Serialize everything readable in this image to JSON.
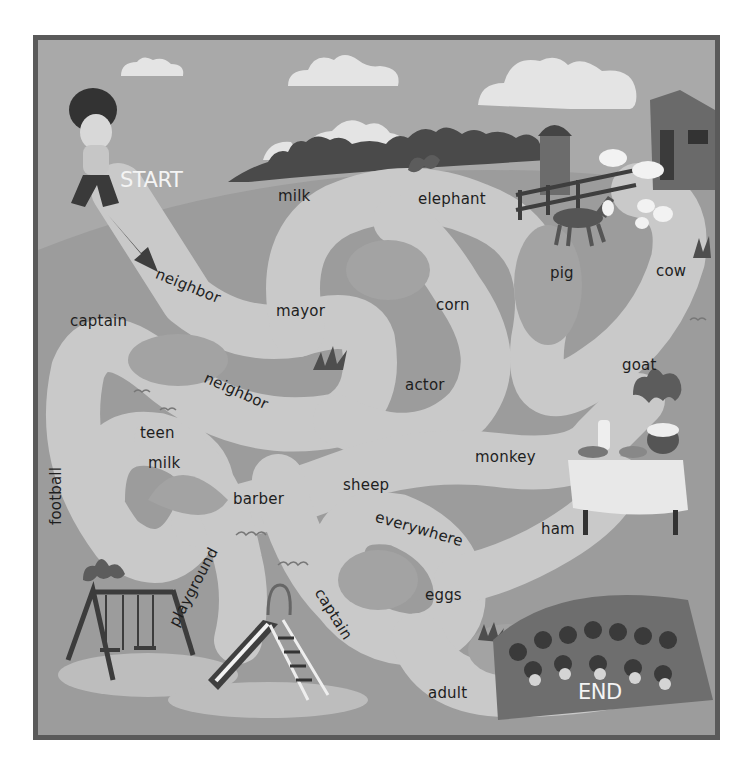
{
  "game": {
    "type": "word-maze",
    "start_label": "START",
    "end_label": "END"
  },
  "colors": {
    "frame": "#5a5a5a",
    "sky": "#a9a9a9",
    "cloud": "#e4e4e4",
    "hill": "#9c9c9c",
    "path": "#c9c9c9",
    "path_hole": "#a3a3a3",
    "trees": "#4a4a4a",
    "text": "#1e1e1e",
    "marker_text": "#f4f4f4"
  },
  "maze_words": [
    {
      "id": "milk-top",
      "label": "milk"
    },
    {
      "id": "elephant",
      "label": "elephant"
    },
    {
      "id": "neighbor-1",
      "label": "neighbor"
    },
    {
      "id": "pig",
      "label": "pig"
    },
    {
      "id": "cow",
      "label": "cow"
    },
    {
      "id": "captain-1",
      "label": "captain"
    },
    {
      "id": "mayor",
      "label": "mayor"
    },
    {
      "id": "corn",
      "label": "corn"
    },
    {
      "id": "goat",
      "label": "goat"
    },
    {
      "id": "neighbor-2",
      "label": "neighbor"
    },
    {
      "id": "actor",
      "label": "actor"
    },
    {
      "id": "teen",
      "label": "teen"
    },
    {
      "id": "monkey",
      "label": "monkey"
    },
    {
      "id": "football",
      "label": "football"
    },
    {
      "id": "milk-bottom",
      "label": "milk"
    },
    {
      "id": "barber",
      "label": "barber"
    },
    {
      "id": "sheep",
      "label": "sheep"
    },
    {
      "id": "everywhere",
      "label": "everywhere"
    },
    {
      "id": "ham",
      "label": "ham"
    },
    {
      "id": "playground",
      "label": "playground"
    },
    {
      "id": "captain-2",
      "label": "captain"
    },
    {
      "id": "eggs",
      "label": "eggs"
    },
    {
      "id": "adult",
      "label": "adult"
    }
  ],
  "scenery": [
    "kid-character",
    "farm-barn",
    "silo",
    "horse",
    "cows",
    "sheep-flock",
    "picnic-table",
    "swing-set",
    "slide",
    "crowd-of-people",
    "clouds",
    "bushes",
    "grass-tufts",
    "birds"
  ]
}
